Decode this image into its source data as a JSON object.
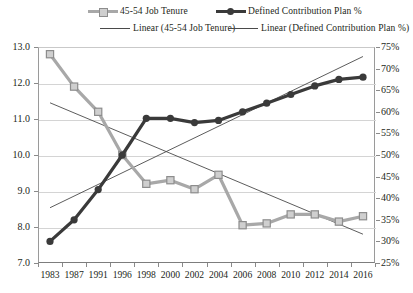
{
  "chart_data": {
    "type": "line",
    "title": "",
    "subtitle": "",
    "xlabel": "",
    "ylabel": "",
    "grid": true,
    "legend_position": "top",
    "categories": [
      "1983",
      "1987",
      "1991",
      "1996",
      "1998",
      "2000",
      "2002",
      "2004",
      "2006",
      "2008",
      "2010",
      "2012",
      "2014",
      "2016"
    ],
    "left_axis": {
      "label": "",
      "ylim": [
        7.0,
        13.0
      ],
      "ticks": [
        "7.0",
        "8.0",
        "9.0",
        "10.0",
        "11.0",
        "12.0",
        "13.0"
      ]
    },
    "right_axis": {
      "label": "",
      "ylim": [
        25,
        75
      ],
      "ticks": [
        "25%",
        "30%",
        "35%",
        "40%",
        "45%",
        "50%",
        "55%",
        "60%",
        "65%",
        "70%",
        "75%"
      ]
    },
    "series": [
      {
        "name": "45-54 Job Tenure",
        "axis": "left",
        "color": "#a8a8a8",
        "marker": "square",
        "values": [
          12.8,
          11.9,
          11.2,
          10.0,
          9.2,
          9.3,
          9.05,
          9.45,
          8.05,
          8.1,
          8.35,
          8.35,
          8.15,
          8.3
        ]
      },
      {
        "name": "Defined Contribution Plan %",
        "axis": "right",
        "color": "#3a3a3a",
        "marker": "circle",
        "values": [
          30,
          35,
          42,
          50,
          58.5,
          58.5,
          57.5,
          58,
          60,
          62,
          64,
          66,
          67.5,
          68
        ]
      }
    ],
    "trendlines": [
      {
        "name": "Linear (45-54 Job Tenure)",
        "axis": "left",
        "color": "#4a4a4a",
        "start_value": 11.45,
        "end_value": 7.8
      },
      {
        "name": "Linear (Defined Contribution Plan %)",
        "axis": "right",
        "color": "#4a4a4a",
        "start_value": 37.8,
        "end_value": 72.8
      }
    ]
  },
  "legend": {
    "items": [
      {
        "label": "45-54 Job Tenure",
        "icon": "line-square-marker-swatch"
      },
      {
        "label": "Defined Contribution Plan %",
        "icon": "line-circle-marker-swatch"
      },
      {
        "label": "Linear (45-54 Job Tenure)",
        "icon": "plain-line-swatch"
      },
      {
        "label": "Linear (Defined Contribution Plan %)",
        "icon": "plain-line-swatch"
      }
    ]
  }
}
